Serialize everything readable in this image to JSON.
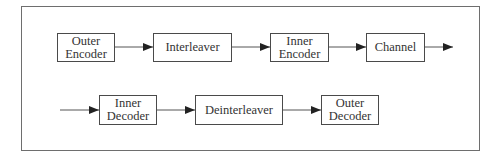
{
  "diagram": {
    "type": "block-diagram",
    "title": "",
    "colors": {
      "stroke": "#4a4a4a",
      "frame": "#6e6e6e",
      "text": "#333333",
      "background": "#ffffff"
    },
    "rows": [
      {
        "blocks": [
          {
            "id": "outer-encoder",
            "lines": [
              "Outer",
              "Encoder"
            ]
          },
          {
            "id": "interleaver",
            "lines": [
              "Interleaver"
            ]
          },
          {
            "id": "inner-encoder",
            "lines": [
              "Inner",
              "Encoder"
            ]
          },
          {
            "id": "channel",
            "lines": [
              "Channel"
            ]
          }
        ]
      },
      {
        "blocks": [
          {
            "id": "inner-decoder",
            "lines": [
              "Inner",
              "Decoder"
            ]
          },
          {
            "id": "deinterleaver",
            "lines": [
              "Deinterleaver"
            ]
          },
          {
            "id": "outer-decoder",
            "lines": [
              "Outer",
              "Decoder"
            ]
          }
        ]
      }
    ],
    "edges": [
      {
        "from": "outer-encoder",
        "to": "interleaver"
      },
      {
        "from": "interleaver",
        "to": "inner-encoder"
      },
      {
        "from": "inner-encoder",
        "to": "channel"
      },
      {
        "from": "channel",
        "to": "output"
      },
      {
        "from": "input",
        "to": "inner-decoder"
      },
      {
        "from": "inner-decoder",
        "to": "deinterleaver"
      },
      {
        "from": "deinterleaver",
        "to": "outer-decoder"
      }
    ]
  }
}
